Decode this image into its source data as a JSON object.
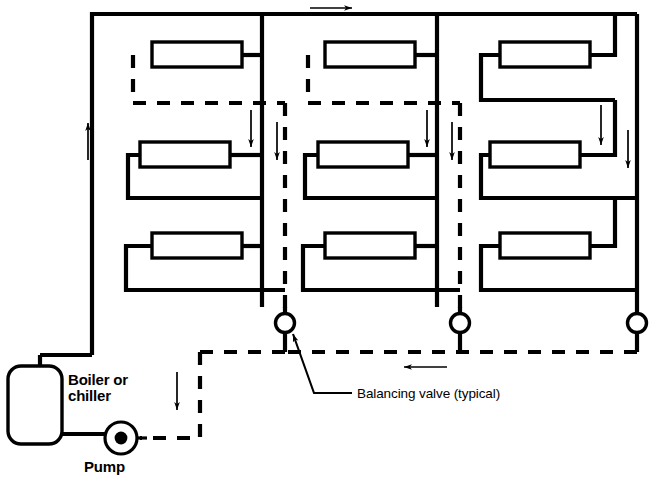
{
  "diagram": {
    "type": "piping-schematic",
    "width": 649,
    "height": 491,
    "colors": {
      "line": "#000000",
      "background": "#ffffff"
    },
    "labels": {
      "boiler": "Boiler or\nchiller",
      "boiler_line1": "Boiler or",
      "boiler_line2": "chiller",
      "pump": "Pump",
      "balancing_valve": "Balancing valve (typical)"
    },
    "components": {
      "equipment": [
        {
          "name": "boiler-or-chiller",
          "label": "Boiler or chiller",
          "shape": "rounded-rectangle"
        },
        {
          "name": "pump",
          "label": "Pump",
          "shape": "circle-with-dot"
        }
      ],
      "valves": [
        {
          "name": "balancing-valve-1",
          "label": "Balancing valve (typical)",
          "x": 285,
          "y": 323
        },
        {
          "name": "balancing-valve-2",
          "label": "Balancing valve",
          "x": 460,
          "y": 323
        },
        {
          "name": "balancing-valve-3",
          "label": "Balancing valve",
          "x": 637,
          "y": 323
        }
      ],
      "coil_banks": [
        {
          "name": "coil-bank-1",
          "coils": 3
        },
        {
          "name": "coil-bank-2",
          "coils": 3
        },
        {
          "name": "coil-bank-3",
          "coils": 3
        }
      ],
      "coils": [
        {
          "name": "coil-1-1",
          "x": 152,
          "y": 42,
          "w": 90,
          "h": 25
        },
        {
          "name": "coil-1-2",
          "x": 140,
          "y": 142,
          "w": 90,
          "h": 25
        },
        {
          "name": "coil-1-3",
          "x": 152,
          "y": 233,
          "w": 90,
          "h": 25
        },
        {
          "name": "coil-2-1",
          "x": 325,
          "y": 42,
          "w": 90,
          "h": 25
        },
        {
          "name": "coil-2-2",
          "x": 318,
          "y": 142,
          "w": 90,
          "h": 25
        },
        {
          "name": "coil-2-3",
          "x": 325,
          "y": 233,
          "w": 90,
          "h": 25
        },
        {
          "name": "coil-3-1",
          "x": 500,
          "y": 42,
          "w": 90,
          "h": 25
        },
        {
          "name": "coil-3-2",
          "x": 490,
          "y": 142,
          "w": 90,
          "h": 25
        },
        {
          "name": "coil-3-3",
          "x": 500,
          "y": 233,
          "w": 90,
          "h": 25
        }
      ],
      "flow_arrows": [
        {
          "name": "flow-arrow-supply-top",
          "direction": "right"
        },
        {
          "name": "flow-arrow-supply-riser",
          "direction": "up"
        },
        {
          "name": "flow-arrow-return-bottom",
          "direction": "left"
        },
        {
          "name": "flow-arrow-return-riser-left",
          "direction": "down"
        },
        {
          "name": "flow-arrow-branch-1",
          "direction": "down"
        },
        {
          "name": "flow-arrow-branch-2",
          "direction": "down"
        },
        {
          "name": "flow-arrow-branch-3",
          "direction": "down"
        },
        {
          "name": "flow-arrow-branch-4",
          "direction": "down"
        },
        {
          "name": "flow-arrow-branch-5",
          "direction": "down"
        },
        {
          "name": "flow-arrow-branch-6",
          "direction": "down"
        }
      ],
      "line_styles": {
        "supply": "solid",
        "return": "dashed"
      }
    }
  }
}
